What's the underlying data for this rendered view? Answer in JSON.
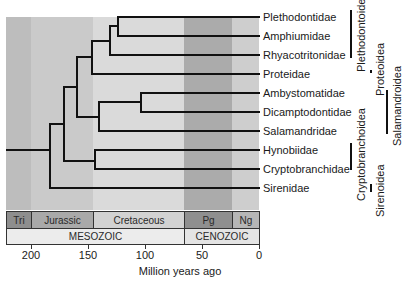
{
  "diagram": {
    "type": "phylogenetic-tree",
    "taxa": [
      "Plethodontidae",
      "Amphiumidae",
      "Rhyacotritonidae",
      "Proteidae",
      "Ambystomatidae",
      "Dicamptodontidae",
      "Salamandridae",
      "Hynobiidae",
      "Cryptobranchidae",
      "Sirenidae"
    ],
    "clades": [
      {
        "name": "Plethodontoidea",
        "members": [
          "Plethodontidae",
          "Amphiumidae",
          "Rhyacotritonidae"
        ]
      },
      {
        "name": "Proteoidea",
        "members": [
          "Proteidae"
        ]
      },
      {
        "name": "Salamandroidea",
        "members": [
          "Ambystomatidae",
          "Dicamptodontidae",
          "Salamandridae"
        ]
      },
      {
        "name": "Cryptobranchoidea",
        "members": [
          "Hynobiidae",
          "Cryptobranchidae"
        ]
      },
      {
        "name": "Sirenoidea",
        "members": [
          "Sirenidae"
        ]
      }
    ],
    "periods": [
      {
        "label": "Tri",
        "color": "#8c8c8c"
      },
      {
        "label": "Jurassic",
        "color": "#a8a8a8"
      },
      {
        "label": "Cretaceous",
        "color": "#cfcfcf"
      },
      {
        "label": "Pg",
        "color": "#8f8f8f"
      },
      {
        "label": "Ng",
        "color": "#b4b4b4"
      }
    ],
    "eras": [
      {
        "label": "MESOZOIC"
      },
      {
        "label": "CENOZOIC"
      }
    ],
    "axis": {
      "ticks": [
        "200",
        "150",
        "100",
        "50",
        "0"
      ],
      "title": "Million years ago"
    },
    "band_colors": {
      "tri": "#b9b9b9",
      "jurassic": "#c6c6c6",
      "cretaceous": "#d9d9d9",
      "pg": "#a9a9a9",
      "ng": "#cdcdcd"
    }
  }
}
